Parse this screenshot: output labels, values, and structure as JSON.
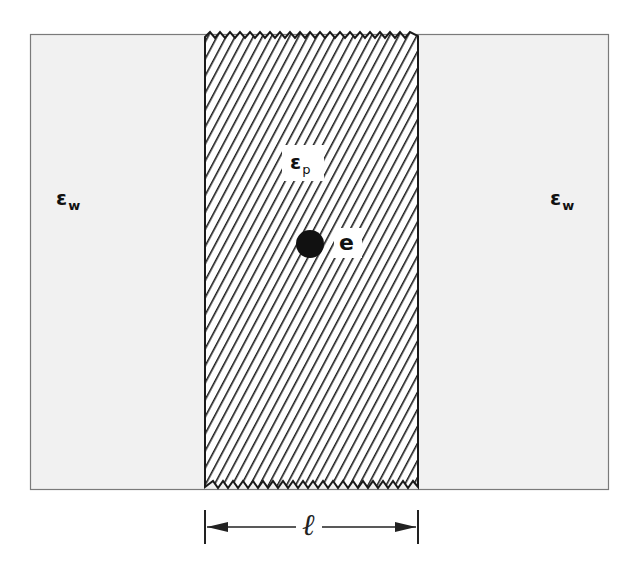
{
  "diagram": {
    "type": "dielectric slab cross-section",
    "colors": {
      "background": "#ffffff",
      "region_fill": "#f1f1f1",
      "region_border": "#7a7a7a",
      "hatch": "#1a1a1a",
      "ink": "#111111"
    },
    "regions": [
      {
        "id": "left-water",
        "label_symbol": "ε",
        "label_subscript": "w"
      },
      {
        "id": "slab",
        "label_symbol": "ε",
        "label_subscript": "p",
        "pattern": "diagonal-hatch",
        "edges": "zigzag top and bottom"
      },
      {
        "id": "right-water",
        "label_symbol": "ε",
        "label_subscript": "w"
      }
    ],
    "charge": {
      "label": "e",
      "shape": "filled-circle"
    },
    "dimension": {
      "label": "ℓ",
      "spans": "slab width"
    }
  }
}
